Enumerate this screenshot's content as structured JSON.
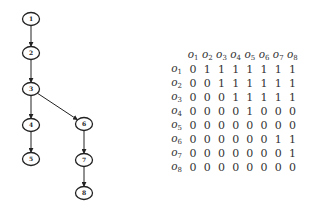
{
  "graph": {
    "nodes": [
      {
        "id": "1",
        "x": 31,
        "y": 19
      },
      {
        "id": "2",
        "x": 31,
        "y": 53
      },
      {
        "id": "3",
        "x": 31,
        "y": 89
      },
      {
        "id": "4",
        "x": 31,
        "y": 125
      },
      {
        "id": "5",
        "x": 31,
        "y": 159
      },
      {
        "id": "6",
        "x": 84,
        "y": 124
      },
      {
        "id": "7",
        "x": 84,
        "y": 160
      },
      {
        "id": "8",
        "x": 84,
        "y": 193
      }
    ],
    "edges": [
      [
        "1",
        "2"
      ],
      [
        "2",
        "3"
      ],
      [
        "3",
        "4"
      ],
      [
        "3",
        "6"
      ],
      [
        "4",
        "5"
      ],
      [
        "6",
        "7"
      ],
      [
        "7",
        "8"
      ]
    ]
  },
  "matrix": {
    "symbol": "o",
    "col_headers": [
      "1",
      "2",
      "3",
      "4",
      "5",
      "6",
      "7",
      "8"
    ],
    "row_headers": [
      "1",
      "2",
      "3",
      "4",
      "5",
      "6",
      "7",
      "8"
    ],
    "rows": [
      [
        "0",
        "1",
        "1",
        "1",
        "1",
        "1",
        "1",
        "1"
      ],
      [
        "0",
        "0",
        "1",
        "1",
        "1",
        "1",
        "1",
        "1"
      ],
      [
        "0",
        "0",
        "0",
        "1",
        "1",
        "1",
        "1",
        "1"
      ],
      [
        "0",
        "0",
        "0",
        "0",
        "1",
        "0",
        "0",
        "0"
      ],
      [
        "0",
        "0",
        "0",
        "0",
        "0",
        "0",
        "0",
        "0"
      ],
      [
        "0",
        "0",
        "0",
        "0",
        "0",
        "0",
        "1",
        "1"
      ],
      [
        "0",
        "0",
        "0",
        "0",
        "0",
        "0",
        "0",
        "1"
      ],
      [
        "0",
        "0",
        "0",
        "0",
        "0",
        "0",
        "0",
        "0"
      ]
    ]
  }
}
